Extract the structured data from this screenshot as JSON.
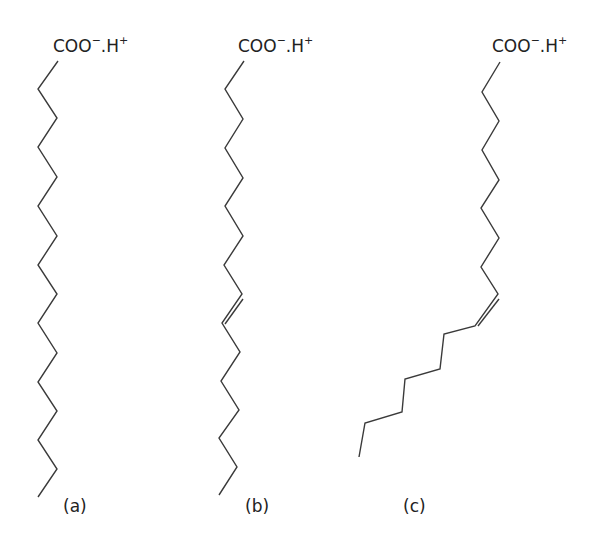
{
  "diagram": {
    "colors": {
      "line": "#3a3a3a",
      "text": "#222222",
      "background": "#ffffff"
    },
    "molecules": [
      {
        "id": "a",
        "label": "(a)",
        "head_group": {
          "main": "COO",
          "charge1": "−",
          "sep": ".H",
          "charge2": "+"
        },
        "type": "saturated",
        "points": "58,61 38,89 57,118 38,147 57,177 38,206 57,236 38,265 57,294 38,323 57,353 38,382 57,411 38,440 57,469 38,497",
        "double_bond": null
      },
      {
        "id": "b",
        "label": "(b)",
        "head_group": {
          "main": "COO",
          "charge1": "−",
          "sep": ".H",
          "charge2": "+"
        },
        "type": "trans-unsaturated",
        "points": "244,61 225,89 243,119 225,148 243,178 225,206 243,236 224,265 242,294 222,323 240,352 221,381 239,410 219,438 237,467 219,495",
        "double_bond": {
          "x1": 239,
          "y1": 297,
          "x2": 221,
          "y2": 322
        }
      },
      {
        "id": "c",
        "label": "(c)",
        "head_group": {
          "main": "COO",
          "charge1": "−",
          "sep": ".H",
          "charge2": "+"
        },
        "type": "cis-unsaturated",
        "points": "500,62 482,92 499,121 482,150 499,180 481,208 499,238 481,267 498,294 475,326 444,334 440,369 405,379 402,412 365,423 359,457",
        "double_bond": {
          "x1": 495,
          "y1": 297,
          "x2": 474,
          "y2": 324
        }
      }
    ]
  }
}
